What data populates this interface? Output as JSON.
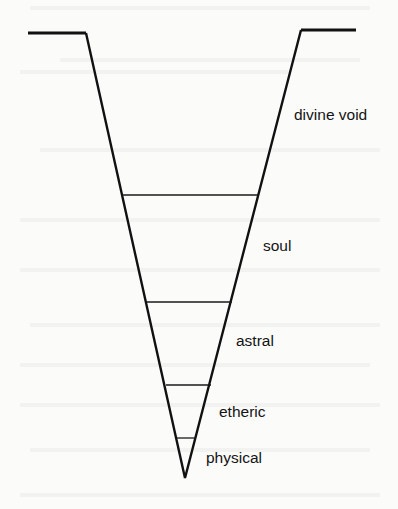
{
  "diagram": {
    "type": "inverted-cone-levels",
    "colors": {
      "line": "#111111",
      "text": "#141414",
      "background": "#fbfbfa"
    },
    "outline": {
      "left_flat": {
        "x1": 28,
        "y1": 33,
        "x2": 86,
        "y2": 33
      },
      "right_flat": {
        "x1": 301,
        "y1": 30,
        "x2": 356,
        "y2": 30
      },
      "vertex": {
        "x": 185,
        "y": 478
      }
    },
    "dividers": [
      {
        "y": 195,
        "x1": 122,
        "x2": 258
      },
      {
        "y": 302,
        "x1": 147,
        "x2": 232
      },
      {
        "y": 385,
        "x1": 166,
        "x2": 211
      },
      {
        "y": 438,
        "x1": 177,
        "x2": 196
      }
    ],
    "levels": [
      {
        "label": "divine void",
        "x": 294,
        "y": 120
      },
      {
        "label": "soul",
        "x": 263,
        "y": 251
      },
      {
        "label": "astral",
        "x": 236,
        "y": 346
      },
      {
        "label": "etheric",
        "x": 219,
        "y": 417
      },
      {
        "label": "physical",
        "x": 206,
        "y": 463
      }
    ]
  }
}
